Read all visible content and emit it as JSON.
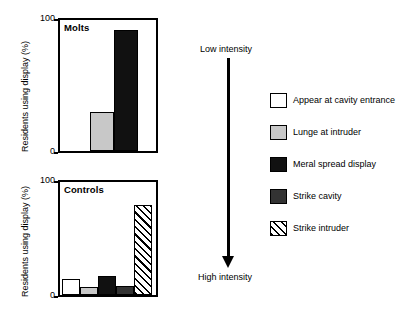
{
  "chart_data": [
    {
      "type": "bar",
      "title": "Molts",
      "xlabel": "",
      "ylabel": "Residents using display (%)",
      "ylim": [
        0,
        100
      ],
      "yticks": [
        0,
        100
      ],
      "ytick_labels": [
        "0",
        "100"
      ],
      "grid": false,
      "categories": [
        "Lunge at intruder",
        "Meral spread display"
      ],
      "values": [
        30,
        92
      ],
      "fills": [
        "gray",
        "black"
      ]
    },
    {
      "type": "bar",
      "title": "Controls",
      "xlabel": "",
      "ylabel": "Residents using display (%)",
      "ylim": [
        0,
        100
      ],
      "yticks": [
        0,
        100
      ],
      "ytick_labels": [
        "0",
        "100"
      ],
      "grid": false,
      "categories": [
        "Appear at cavity entrance",
        "Lunge at intruder",
        "Meral spread display",
        "Strike cavity",
        "Strike intruder"
      ],
      "values": [
        14,
        7,
        17,
        8,
        80
      ],
      "fills": [
        "white",
        "gray",
        "black",
        "dark",
        "hatch"
      ]
    }
  ],
  "panels": {
    "molts": {
      "label": "Molts",
      "y_title": "Residents using display (%)",
      "tick_top": "100",
      "tick_bottom": "0"
    },
    "controls": {
      "label": "Controls",
      "y_title": "Residents using display (%)",
      "tick_top": "100",
      "tick_bottom": "0"
    }
  },
  "intensity_axis": {
    "low_label": "Low intensity",
    "high_label": "High intensity",
    "arrow_icon": "down-arrow-icon"
  },
  "legend": {
    "position": "right",
    "items": [
      {
        "label": "Appear at cavity entrance",
        "fill": "white",
        "color": "#ffffff"
      },
      {
        "label": "Lunge at intruder",
        "fill": "gray",
        "color": "#c8c8c8"
      },
      {
        "label": "Meral spread display",
        "fill": "black",
        "color": "#111111"
      },
      {
        "label": "Strike cavity",
        "fill": "dark",
        "color": "#333333"
      },
      {
        "label": "Strike intruder",
        "fill": "hatch",
        "color": "#ffffff"
      }
    ]
  }
}
